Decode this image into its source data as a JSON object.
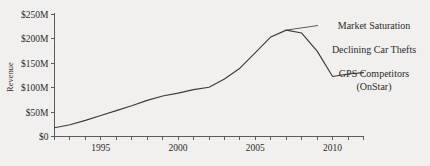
{
  "chart_data": {
    "type": "line",
    "title": "",
    "subtitle": "",
    "xlabel": "",
    "ylabel": "Revenue",
    "xlim": [
      1991.6,
      1991.6
    ],
    "ylim": [
      0,
      250
    ],
    "grid": false,
    "legend_position": "none",
    "y_unit": "$M",
    "x_axis": {
      "tick_years": [
        1992,
        1993,
        1994,
        1995,
        1996,
        1997,
        1998,
        1999,
        2000,
        2001,
        2002,
        2003,
        2004,
        2005,
        2006,
        2007,
        2008,
        2009,
        2010,
        2011,
        2012
      ],
      "labeled_ticks": [
        {
          "year": 1995,
          "label": "1995"
        },
        {
          "year": 2000,
          "label": "2000"
        },
        {
          "year": 2005,
          "label": "2005"
        },
        {
          "year": 2010,
          "label": "2010"
        }
      ]
    },
    "y_axis": {
      "ticks": [
        0,
        50,
        100,
        150,
        200,
        250
      ],
      "tick_labels": [
        "$0",
        "$50M",
        "$100M",
        "$150M",
        "$200M",
        "$250M"
      ]
    },
    "series": [
      {
        "name": "Revenue",
        "color": "#3c3c3c",
        "x": [
          1992,
          1993,
          1994,
          1995,
          1996,
          1997,
          1998,
          1999,
          2000,
          2001,
          2002,
          2003,
          2004,
          2005,
          2006,
          2007,
          2008,
          2009,
          2010,
          2011,
          2012
        ],
        "values": [
          18,
          24,
          33,
          43,
          53,
          63,
          74,
          83,
          89,
          96,
          101,
          118,
          140,
          172,
          204,
          218,
          212,
          175,
          123,
          128,
          131
        ]
      }
    ],
    "annotations": [
      {
        "text": "Market Saturation",
        "target_year": 2007,
        "target_value": 218
      },
      {
        "text": "Declining Car Thefts",
        "target_year": 2009,
        "target_value": 175
      },
      {
        "text": "GPS Competitors",
        "text_line2": "(OnStar)",
        "target_year": 2011,
        "target_value": 128
      }
    ]
  },
  "annotations_text": {
    "market_saturation": "Market Saturation",
    "declining_car_thefts": "Declining Car Thefts",
    "gps_competitors_line1": "GPS Competitors",
    "gps_competitors_line2": "(OnStar)"
  },
  "axis_labels": {
    "y_title": "Revenue",
    "y0": "$0",
    "y50": "$50M",
    "y100": "$100M",
    "y150": "$150M",
    "y200": "$200M",
    "y250": "$250M",
    "x1995": "1995",
    "x2000": "2000",
    "x2005": "2005",
    "x2010": "2010"
  },
  "colors": {
    "background": "#f1f0ee",
    "line": "#3c3c3c",
    "axis": "#5b5b5b",
    "text": "#2b2b2b"
  }
}
